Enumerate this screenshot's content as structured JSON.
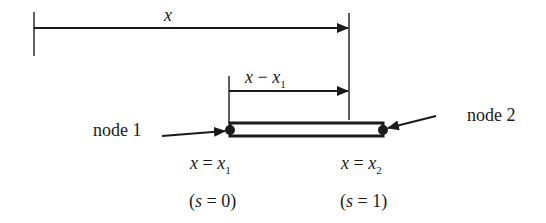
{
  "diagram": {
    "type": "1D bar element with two nodes",
    "colors": {
      "stroke": "#1a1a1a",
      "background": "#ffffff"
    },
    "dimension_x": {
      "var": "x",
      "label": "x"
    },
    "dimension_x_minus_x1": {
      "var": "x",
      "minus": " − ",
      "var2": "x",
      "sub2": "1"
    },
    "node1": {
      "label": "node 1"
    },
    "node2": {
      "label": "node 2"
    },
    "left_end": {
      "lhs": "x",
      "eq": " = ",
      "rhs": "x",
      "sub": "1",
      "param_open": "(",
      "param_var": "s",
      "param_eq": " = 0)"
    },
    "right_end": {
      "lhs": "x",
      "eq": " = ",
      "rhs": "x",
      "sub": "2",
      "param_open": "(",
      "param_var": "s",
      "param_eq": " = 1)"
    }
  }
}
